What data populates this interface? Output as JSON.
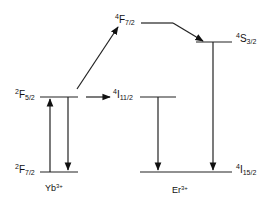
{
  "diagram": {
    "type": "energy-level-diagram",
    "ions": [
      {
        "name": "Yb",
        "charge": "3+"
      },
      {
        "name": "Er",
        "charge": "3+"
      }
    ],
    "levels": {
      "yb_f52": {
        "mult": "2",
        "term": "F",
        "j": "5/2"
      },
      "yb_f72": {
        "mult": "2",
        "term": "F",
        "j": "7/2"
      },
      "er_f72": {
        "mult": "4",
        "term": "F",
        "j": "7/2"
      },
      "er_s32": {
        "mult": "4",
        "term": "S",
        "j": "3/2"
      },
      "er_i112": {
        "mult": "4",
        "term": "I",
        "j": "11/2"
      },
      "er_i152": {
        "mult": "4",
        "term": "I",
        "j": "15/2"
      }
    },
    "transitions": [
      {
        "from": "yb_f72",
        "to": "yb_f52",
        "kind": "absorption"
      },
      {
        "from": "yb_f52",
        "to": "yb_f72",
        "kind": "emission"
      },
      {
        "from": "yb_f52",
        "to": "er_i112",
        "kind": "energy-transfer"
      },
      {
        "from": "yb_f52",
        "to": "er_f72",
        "kind": "energy-transfer"
      },
      {
        "from": "er_f72",
        "to": "er_s32",
        "kind": "non-radiative"
      },
      {
        "from": "er_s32",
        "to": "er_i152",
        "kind": "emission"
      },
      {
        "from": "er_i112",
        "to": "er_i152",
        "kind": "emission"
      }
    ],
    "colors": {
      "line": "#111111",
      "background": "#ffffff"
    }
  }
}
